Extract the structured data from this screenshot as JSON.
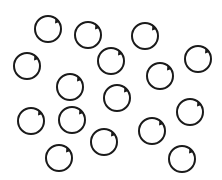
{
  "canvas": {
    "width": 222,
    "height": 180,
    "background": "#ffffff"
  },
  "style": {
    "stroke": "#1a1a1a",
    "radius": 13,
    "stroke_width": 2
  },
  "rings": [
    {
      "x": 48,
      "y": 29
    },
    {
      "x": 88,
      "y": 35
    },
    {
      "x": 145,
      "y": 36
    },
    {
      "x": 27,
      "y": 66
    },
    {
      "x": 111,
      "y": 61
    },
    {
      "x": 198,
      "y": 59
    },
    {
      "x": 160,
      "y": 76
    },
    {
      "x": 70,
      "y": 87
    },
    {
      "x": 117,
      "y": 98
    },
    {
      "x": 31,
      "y": 121
    },
    {
      "x": 72,
      "y": 120
    },
    {
      "x": 190,
      "y": 112
    },
    {
      "x": 152,
      "y": 131
    },
    {
      "x": 104,
      "y": 142
    },
    {
      "x": 59,
      "y": 158
    },
    {
      "x": 182,
      "y": 159
    }
  ]
}
